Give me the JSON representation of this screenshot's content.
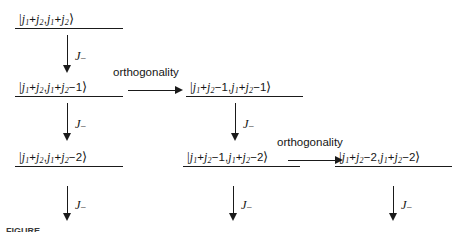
{
  "figure": {
    "type": "angular-momentum-ladder-diagram",
    "caption_fragment": "FIGURE",
    "ink_color": "#1a1a1a",
    "background_color": "#ffffff"
  },
  "operators": {
    "lowering_label": "J",
    "lowering_subscript": "−",
    "orthogonality_label": "orthogonality"
  },
  "nodes": [
    {
      "id": "n-r1c1",
      "row": 1,
      "column": 1,
      "bra_open": "|",
      "first_index": "j",
      "text": "|j₁+j₂,j₁+j₂⟩",
      "m_value": "j1+j2",
      "j_value": "j1+j2"
    },
    {
      "id": "n-r2c1",
      "row": 2,
      "column": 1,
      "text": "|j₁+j₂,j₁+j₂−1⟩",
      "m_value": "j1+j2-1",
      "j_value": "j1+j2"
    },
    {
      "id": "n-r2c2",
      "row": 2,
      "column": 2,
      "text": "|j₁+j₂−1,j₁+j₂−1⟩",
      "m_value": "j1+j2-1",
      "j_value": "j1+j2-1"
    },
    {
      "id": "n-r3c1",
      "row": 3,
      "column": 1,
      "text": "|j₁+j₂,j₁+j₂−2⟩",
      "m_value": "j1+j2-2",
      "j_value": "j1+j2"
    },
    {
      "id": "n-r3c2",
      "row": 3,
      "column": 2,
      "text": "|j₁+j₂−1,j₁+j₂−2⟩",
      "m_value": "j1+j2-2",
      "j_value": "j1+j2-1"
    },
    {
      "id": "n-r3c3",
      "row": 3,
      "column": 3,
      "text": "|j₁+j₂−2,j₁+j₂−2⟩",
      "m_value": "j1+j2-2",
      "j_value": "j1+j2-2"
    }
  ],
  "vertical_arrows": [
    {
      "id": "v-c1-r1r2",
      "label": "J",
      "subscript": "−",
      "from": "n-r1c1",
      "to": "n-r2c1"
    },
    {
      "id": "v-c1-r2r3",
      "label": "J",
      "subscript": "−",
      "from": "n-r2c1",
      "to": "n-r3c1"
    },
    {
      "id": "v-c1-r3out",
      "label": "J",
      "subscript": "−",
      "from": "n-r3c1",
      "to": ""
    },
    {
      "id": "v-c2-r2r3",
      "label": "J",
      "subscript": "−",
      "from": "n-r2c2",
      "to": "n-r3c2"
    },
    {
      "id": "v-c2-r3out",
      "label": "J",
      "subscript": "−",
      "from": "n-r3c2",
      "to": ""
    },
    {
      "id": "v-c3-r3out",
      "label": "J",
      "subscript": "−",
      "from": "n-r3c3",
      "to": ""
    }
  ],
  "horizontal_arrows": [
    {
      "id": "h-r2",
      "label": "orthogonality",
      "from": "n-r2c1",
      "to": "n-r2c2"
    },
    {
      "id": "h-r3",
      "label": "orthogonality",
      "from": "n-r3c2",
      "to": "n-r3c3"
    }
  ]
}
